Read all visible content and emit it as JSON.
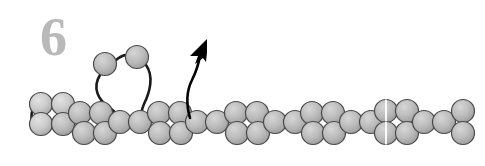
{
  "figure": {
    "panel_label": "6",
    "caption_text": "",
    "background_color": "#ffffff",
    "width": 485,
    "height": 166
  },
  "style": {
    "bead_fill_light": "#cfcfcf",
    "bead_fill_mid": "#b2b2b2",
    "bead_fill_dark": "#9a9a9a",
    "bead_stroke": "#4a4a4a",
    "linker_stroke": "#1a1a1a",
    "arrow_color": "#000000",
    "label_color": "#b9b9b9",
    "split_line_color": "#ffffff",
    "bead_radius": 11.5,
    "bead_stroke_width": 1.2,
    "linker_stroke_width": 2.6
  },
  "diagram": {
    "rows": {
      "top_y": 104,
      "middle_y": 120,
      "bottom_y": 136
    },
    "fiber_beads": [
      {
        "id": "b01",
        "cx": 41,
        "cy": 104,
        "shade": "light"
      },
      {
        "id": "b02",
        "cx": 63,
        "cy": 104,
        "shade": "light"
      },
      {
        "id": "b03",
        "cx": 41,
        "cy": 124,
        "shade": "light"
      },
      {
        "id": "b04",
        "cx": 63,
        "cy": 124,
        "shade": "mid"
      },
      {
        "id": "b05",
        "cx": 80,
        "cy": 113,
        "shade": "mid"
      },
      {
        "id": "b06",
        "cx": 84,
        "cy": 133,
        "shade": "mid"
      },
      {
        "id": "b07",
        "cx": 101,
        "cy": 113,
        "shade": "mid"
      },
      {
        "id": "b08",
        "cx": 105,
        "cy": 133,
        "shade": "mid"
      },
      {
        "id": "b09",
        "cx": 120,
        "cy": 122,
        "shade": "mid"
      },
      {
        "id": "b10",
        "cx": 140,
        "cy": 122,
        "shade": "mid"
      },
      {
        "id": "b11",
        "cx": 159,
        "cy": 113,
        "shade": "mid"
      },
      {
        "id": "b12",
        "cx": 160,
        "cy": 133,
        "shade": "mid"
      },
      {
        "id": "b13",
        "cx": 180,
        "cy": 113,
        "shade": "mid"
      },
      {
        "id": "b14",
        "cx": 181,
        "cy": 133,
        "shade": "mid"
      },
      {
        "id": "b15",
        "cx": 197,
        "cy": 122,
        "shade": "mid"
      },
      {
        "id": "b16",
        "cx": 217,
        "cy": 122,
        "shade": "mid"
      },
      {
        "id": "b17",
        "cx": 236,
        "cy": 113,
        "shade": "mid"
      },
      {
        "id": "b18",
        "cx": 237,
        "cy": 133,
        "shade": "mid"
      },
      {
        "id": "b19",
        "cx": 257,
        "cy": 113,
        "shade": "mid"
      },
      {
        "id": "b20",
        "cx": 258,
        "cy": 133,
        "shade": "mid"
      },
      {
        "id": "b21",
        "cx": 275,
        "cy": 122,
        "shade": "mid"
      },
      {
        "id": "b22",
        "cx": 295,
        "cy": 122,
        "shade": "mid"
      },
      {
        "id": "b23",
        "cx": 312,
        "cy": 113,
        "shade": "mid"
      },
      {
        "id": "b24",
        "cx": 313,
        "cy": 133,
        "shade": "mid"
      },
      {
        "id": "b25",
        "cx": 333,
        "cy": 113,
        "shade": "mid"
      },
      {
        "id": "b26",
        "cx": 334,
        "cy": 133,
        "shade": "mid"
      },
      {
        "id": "b27",
        "cx": 351,
        "cy": 122,
        "shade": "mid"
      },
      {
        "id": "b28",
        "cx": 371,
        "cy": 122,
        "shade": "mid"
      },
      {
        "id": "b29",
        "cx": 386,
        "cy": 111,
        "shade": "mid",
        "split": true
      },
      {
        "id": "b30",
        "cx": 386,
        "cy": 133,
        "shade": "mid",
        "split": true
      },
      {
        "id": "b31",
        "cx": 407,
        "cy": 111,
        "shade": "mid"
      },
      {
        "id": "b32",
        "cx": 407,
        "cy": 133,
        "shade": "mid"
      },
      {
        "id": "b33",
        "cx": 424,
        "cy": 122,
        "shade": "mid"
      },
      {
        "id": "b34",
        "cx": 444,
        "cy": 122,
        "shade": "mid"
      },
      {
        "id": "b35",
        "cx": 463,
        "cy": 111,
        "shade": "mid"
      },
      {
        "id": "b36",
        "cx": 463,
        "cy": 133,
        "shade": "mid"
      }
    ],
    "free_beads": [
      {
        "id": "f01",
        "cx": 105,
        "cy": 64,
        "shade": "mid",
        "label": "detached-nucleosome-left"
      },
      {
        "id": "f02",
        "cx": 137,
        "cy": 57,
        "shade": "mid",
        "label": "detached-nucleosome-right"
      }
    ],
    "linkers": [
      {
        "id": "l1",
        "label": "linker-free-bead-pair",
        "path": "M 116 60 C 122 55 126 54 130 56"
      },
      {
        "id": "l2",
        "label": "linker-left-descend",
        "path": "M 100 75 C 92 88 98 100 110 108 C 116 112 118 116 118 120"
      },
      {
        "id": "l3",
        "label": "linker-right-descend",
        "path": "M 146 65 C 154 76 150 92 144 104 C 140 112 142 118 146 122"
      },
      {
        "id": "l4",
        "label": "linker-left-terminus",
        "path": "M 40 98 C 30 106 29 122 36 130"
      }
    ],
    "arrow": {
      "label": "transfer-arrow",
      "tail_path": "M 190 118 C 186 104 186 92 192 80 C 197 70 199 62 200 55",
      "head_points": "207,39 190,56 198,56 195,64 203,58 206,62 207,52",
      "tip": {
        "x": 207,
        "y": 39
      },
      "origin": {
        "x": 190,
        "y": 118
      }
    }
  }
}
